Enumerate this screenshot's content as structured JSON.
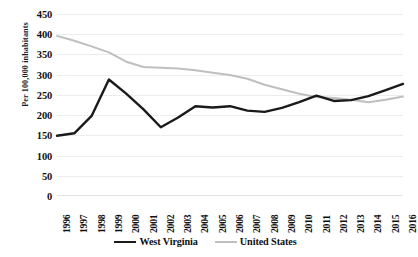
{
  "chart_data": {
    "type": "line",
    "title": "",
    "xlabel": "",
    "ylabel": "Per 100,000 inhabitants",
    "ylim": [
      0,
      450
    ],
    "ytick_step": 50,
    "yticks": [
      "450",
      "400",
      "350",
      "300",
      "250",
      "200",
      "150",
      "100",
      "50",
      "0"
    ],
    "grid": true,
    "legend_position": "bottom",
    "categories": [
      "1996",
      "1997",
      "1998",
      "1999",
      "2000",
      "2001",
      "2002",
      "2003",
      "2004",
      "2005",
      "2006",
      "2007",
      "2008",
      "2009",
      "2010",
      "2011",
      "2012",
      "2013",
      "2014",
      "2015",
      "2016"
    ],
    "series": [
      {
        "name": "West Virginia",
        "color": "#1a1a1a",
        "values": [
          149,
          155,
          198,
          288,
          253,
          214,
          170,
          194,
          222,
          219,
          222,
          211,
          208,
          218,
          232,
          248,
          235,
          237,
          247,
          262,
          277
        ]
      },
      {
        "name": "United States",
        "color": "#bfbfbf",
        "values": [
          396,
          384,
          370,
          355,
          332,
          319,
          317,
          315,
          311,
          305,
          299,
          290,
          275,
          264,
          253,
          245,
          242,
          238,
          232,
          238,
          246
        ]
      }
    ]
  },
  "axis": {
    "y_title": "Per 100,000 inhabitants"
  },
  "legend": {
    "items": [
      {
        "label": "West Virginia"
      },
      {
        "label": "United States"
      }
    ]
  }
}
